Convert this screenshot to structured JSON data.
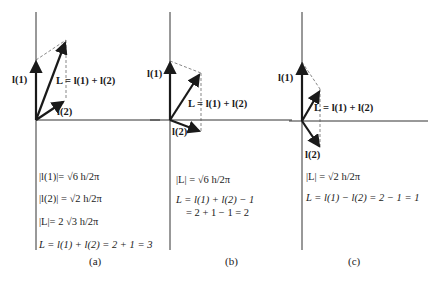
{
  "panels": [
    {
      "id": "a",
      "caption": "(a)",
      "vector_labels": {
        "l1": "l(1)",
        "l2": "l(2)",
        "L": "L = l(1) + l(2)"
      },
      "equations": [
        "|l(1)|= √6 h/2π",
        "|l(2)| = √2 h/2π",
        "|L|= 2 √3 h/2π",
        "L = l(1) + l(2) = 2 + 1 = 3"
      ]
    },
    {
      "id": "b",
      "caption": "(b)",
      "vector_labels": {
        "l1": "l(1)",
        "l2": "l(2)",
        "L": "L = l(1) + l(2)"
      },
      "equations": [
        "|L| = √6 h/2π",
        "L = l(1) + l(2) − 1",
        "= 2 + 1 − 1 = 2"
      ]
    },
    {
      "id": "c",
      "caption": "(c)",
      "vector_labels": {
        "l1": "l(1)",
        "l2": "l(2)",
        "L": "L = l(1) + l(2)"
      },
      "equations": [
        "|L| = √2 h/2π",
        "L = l(1) − l(2) = 2 − 1 = 1"
      ]
    }
  ]
}
